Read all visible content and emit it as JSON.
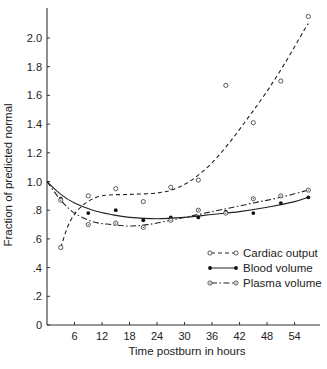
{
  "chart_data": {
    "type": "line",
    "title": "",
    "xlabel": "Time postburn in hours",
    "ylabel": "Fraction of predicted normal",
    "xlim": [
      0,
      60
    ],
    "ylim": [
      0,
      2.2
    ],
    "x_ticks": [
      6,
      12,
      18,
      24,
      30,
      36,
      42,
      48,
      54
    ],
    "x_tick_labels": [
      "6",
      "12",
      "18",
      "24",
      "30",
      "36",
      "42",
      "48",
      "54"
    ],
    "y_ticks": [
      0,
      0.2,
      0.4,
      0.6,
      0.8,
      1.0,
      1.2,
      1.4,
      1.6,
      1.8,
      2.0
    ],
    "y_tick_labels": [
      "0",
      ".2",
      ".4",
      ".6",
      ".8",
      "1.0",
      "1.2",
      "1.4",
      "1.6",
      "1.8",
      "2.0"
    ],
    "grid": false,
    "legend_position": "lower right",
    "series": [
      {
        "name": "Cardiac output",
        "line_style": "dashed",
        "marker": "open-circle",
        "points": [
          [
            3,
            0.54
          ],
          [
            9,
            0.9
          ],
          [
            15,
            0.95
          ],
          [
            21,
            0.86
          ],
          [
            27,
            0.96
          ],
          [
            33,
            1.01
          ],
          [
            39,
            1.67
          ],
          [
            45,
            1.41
          ],
          [
            51,
            1.7
          ],
          [
            57,
            2.15
          ]
        ],
        "fit_curve": [
          [
            3,
            0.54
          ],
          [
            5,
            0.72
          ],
          [
            8,
            0.84
          ],
          [
            12,
            0.9
          ],
          [
            18,
            0.91
          ],
          [
            24,
            0.92
          ],
          [
            28,
            0.95
          ],
          [
            32,
            1.02
          ],
          [
            36,
            1.13
          ],
          [
            40,
            1.28
          ],
          [
            44,
            1.45
          ],
          [
            48,
            1.63
          ],
          [
            52,
            1.83
          ],
          [
            56,
            2.05
          ],
          [
            57,
            2.1
          ]
        ]
      },
      {
        "name": "Blood volume",
        "line_style": "solid",
        "marker": "filled-circle",
        "points": [
          [
            3,
            0.88
          ],
          [
            9,
            0.78
          ],
          [
            15,
            0.8
          ],
          [
            21,
            0.73
          ],
          [
            27,
            0.75
          ],
          [
            33,
            0.75
          ],
          [
            39,
            0.79
          ],
          [
            45,
            0.78
          ],
          [
            51,
            0.85
          ],
          [
            57,
            0.89
          ]
        ],
        "fit_curve": [
          [
            0,
            1.0
          ],
          [
            3,
            0.91
          ],
          [
            6,
            0.85
          ],
          [
            10,
            0.8
          ],
          [
            14,
            0.77
          ],
          [
            18,
            0.75
          ],
          [
            24,
            0.74
          ],
          [
            30,
            0.75
          ],
          [
            36,
            0.77
          ],
          [
            42,
            0.79
          ],
          [
            48,
            0.82
          ],
          [
            54,
            0.86
          ],
          [
            57,
            0.89
          ]
        ]
      },
      {
        "name": "Plasma volume",
        "line_style": "dash-dot",
        "marker": "dotted-circle",
        "points": [
          [
            3,
            0.87
          ],
          [
            9,
            0.7
          ],
          [
            15,
            0.71
          ],
          [
            21,
            0.68
          ],
          [
            27,
            0.73
          ],
          [
            33,
            0.8
          ],
          [
            39,
            0.78
          ],
          [
            45,
            0.88
          ],
          [
            51,
            0.9
          ],
          [
            57,
            0.94
          ]
        ],
        "fit_curve": [
          [
            0,
            1.0
          ],
          [
            3,
            0.87
          ],
          [
            6,
            0.78
          ],
          [
            10,
            0.72
          ],
          [
            14,
            0.7
          ],
          [
            18,
            0.69
          ],
          [
            22,
            0.7
          ],
          [
            27,
            0.73
          ],
          [
            33,
            0.77
          ],
          [
            39,
            0.81
          ],
          [
            45,
            0.85
          ],
          [
            51,
            0.89
          ],
          [
            57,
            0.94
          ]
        ]
      }
    ]
  }
}
